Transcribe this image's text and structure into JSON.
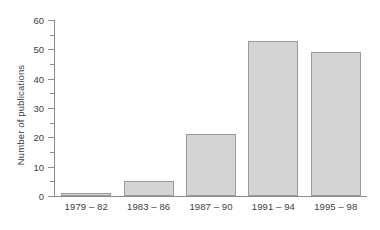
{
  "chart_data": {
    "type": "bar",
    "title": "",
    "xlabel": "",
    "ylabel": "Number of publications",
    "categories": [
      "1979 – 82",
      "1983 – 86",
      "1987 – 90",
      "1991 – 94",
      "1995 – 98"
    ],
    "values": [
      1,
      5,
      21,
      53,
      49
    ],
    "ylim": [
      0,
      60
    ],
    "ytick_labels": [
      "0",
      "10",
      "20",
      "30",
      "40",
      "50",
      "60"
    ],
    "ytick_values": [
      0,
      10,
      20,
      30,
      40,
      50,
      60
    ],
    "yminor_tick_values": [
      5,
      15,
      25,
      35,
      45,
      55
    ],
    "grid": false,
    "legend": null,
    "legend_position": "none",
    "colors": {
      "bar_fill": "#d4d4d4",
      "bar_border": "#9a9a9a",
      "axis": "#8c8c8c",
      "text": "#3d3d3d",
      "background": "#ffffff"
    }
  }
}
